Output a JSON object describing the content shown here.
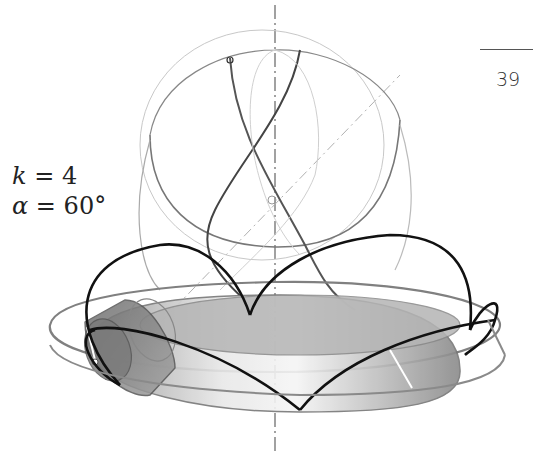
{
  "page": {
    "number": "39"
  },
  "parameters": [
    {
      "symbol": "k",
      "operator": "=",
      "value": "4"
    },
    {
      "symbol": "α",
      "operator": "=",
      "value": "60°"
    }
  ],
  "figure": {
    "colors": {
      "curve_dark": "#111111",
      "curve_mid": "#777777",
      "curve_light": "#aaaaaa",
      "disk_fill": "#bdbdbd",
      "cylinder_fill": "#8c8c8c",
      "axis": "#888888"
    }
  }
}
